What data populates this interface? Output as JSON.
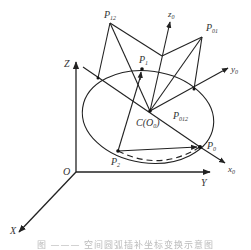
{
  "figure": {
    "caption": "图 ——— 空间圆弧插补坐标变换示意图",
    "colors": {
      "line": "#222222",
      "label": "#333333",
      "background": "#ffffff"
    }
  },
  "labels": {
    "global_axes": {
      "z": "Z",
      "y": "Y",
      "x": "X",
      "origin": "O"
    },
    "local_axes": {
      "z0": "z",
      "z0_sub": "0",
      "y0": "y",
      "y0_sub": "0",
      "x0": "x",
      "x0_sub": "0"
    },
    "points": {
      "p12": "P",
      "p12_sub": "12",
      "p01": "P",
      "p01_sub": "01",
      "p1": "P",
      "p1_sub": "1",
      "p0": "P",
      "p0_sub": "0",
      "p2": "P",
      "p2_sub": "2",
      "p012": "P",
      "p012_sub": "012",
      "center": "C(O",
      "center_sub": "0",
      "center_close": ")"
    }
  }
}
